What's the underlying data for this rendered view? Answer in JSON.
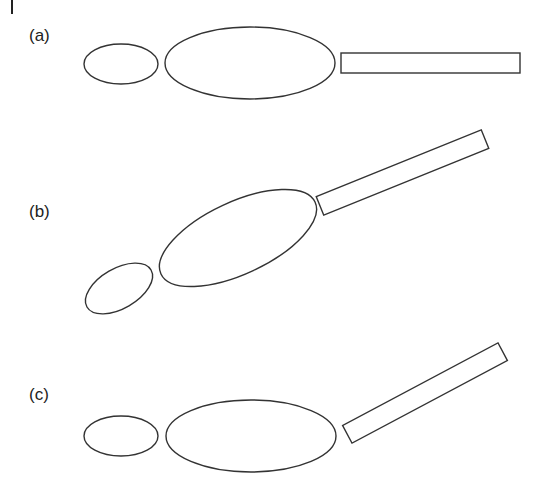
{
  "figure": {
    "stroke_color": "#333333",
    "background": "#ffffff",
    "panels": [
      {
        "label": "(a)",
        "label_pos": [
          29,
          41
        ],
        "small_ellipse": {
          "cx": 121,
          "cy": 64,
          "rx": 37,
          "ry": 20,
          "rotate": 0
        },
        "large_ellipse": {
          "cx": 250,
          "cy": 63,
          "rx": 85,
          "ry": 36,
          "rotate": 0
        },
        "rod": {
          "cx": 430.5,
          "cy": 63,
          "length": 179,
          "width": 20,
          "rotate": 0
        }
      },
      {
        "label": "(b)",
        "label_pos": [
          29,
          217
        ],
        "small_ellipse": {
          "cx": 119,
          "cy": 288.5,
          "rx": 37,
          "ry": 20,
          "rotate": -30
        },
        "large_ellipse": {
          "cx": 238,
          "cy": 238,
          "rx": 85,
          "ry": 36,
          "rotate": -25
        },
        "rod": {
          "cx": 402.5,
          "cy": 172.5,
          "length": 178,
          "width": 20,
          "rotate": -22
        }
      },
      {
        "label": "(c)",
        "label_pos": [
          29,
          400
        ],
        "small_ellipse": {
          "cx": 121,
          "cy": 436,
          "rx": 37,
          "ry": 20,
          "rotate": 0
        },
        "large_ellipse": {
          "cx": 251,
          "cy": 436,
          "rx": 85,
          "ry": 36,
          "rotate": 0
        },
        "rod": {
          "cx": 425,
          "cy": 393,
          "length": 176,
          "width": 20,
          "rotate": -28
        }
      }
    ]
  }
}
